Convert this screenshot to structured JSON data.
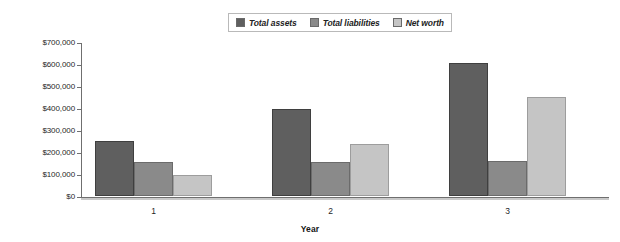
{
  "chart_data": {
    "type": "bar",
    "title": "",
    "xlabel": "Year",
    "ylabel": "",
    "categories": [
      "1",
      "2",
      "3"
    ],
    "series": [
      {
        "name": "Total assets",
        "color": "#5f5f5f",
        "values": [
          250000,
          395000,
          605000
        ]
      },
      {
        "name": "Total liabilities",
        "color": "#8a8a8a",
        "values": [
          155000,
          155000,
          158000
        ]
      },
      {
        "name": "Net worth",
        "color": "#c5c5c5",
        "values": [
          97000,
          237000,
          448000
        ]
      }
    ],
    "ylim": [
      0,
      700000
    ],
    "ytick_values": [
      0,
      100000,
      200000,
      300000,
      400000,
      500000,
      600000,
      700000
    ],
    "ytick_labels": [
      "$0",
      "$100,000",
      "$200,000",
      "$300,000",
      "$400,000",
      "$500,000",
      "$600,000",
      "$700,000"
    ],
    "grid": false,
    "legend_position": "top-center",
    "legend_entries": [
      "Total assets",
      "Total liabilities",
      "Net worth"
    ]
  }
}
